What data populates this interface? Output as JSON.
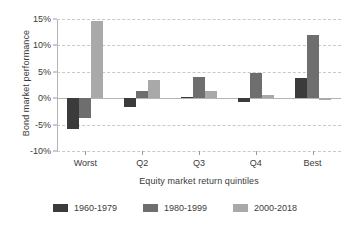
{
  "chart_data": {
    "type": "bar",
    "title": "",
    "xlabel": "Equity market return quintiles",
    "ylabel": "Bond market performance",
    "categories": [
      "Worst",
      "Q2",
      "Q3",
      "Q4",
      "Best"
    ],
    "series": [
      {
        "name": "1960-1979",
        "color": "#3b3b3b",
        "values": [
          -5.8,
          -1.6,
          0.3,
          -0.8,
          3.8
        ]
      },
      {
        "name": "1980-1999",
        "color": "#6e6e6e",
        "values": [
          -3.8,
          1.4,
          4.0,
          4.8,
          11.9
        ]
      },
      {
        "name": "2000-2018",
        "color": "#a9a9a9",
        "values": [
          14.6,
          3.5,
          1.3,
          0.6,
          -0.3
        ]
      }
    ],
    "ylim": [
      -10,
      15
    ],
    "yticks": [
      15,
      10,
      5,
      0,
      -5,
      -10
    ],
    "ytick_labels": [
      "15%",
      "10%",
      "5%",
      "0%",
      "-5%",
      "-10%"
    ],
    "grid": true,
    "legend_position": "bottom",
    "value_suffix": "%"
  }
}
